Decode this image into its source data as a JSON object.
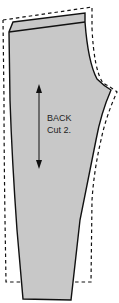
{
  "pattern_piece": {
    "name": "BACK",
    "instruction": "Cut 2.",
    "fill_color": "#c8c8c8",
    "outline_color": "#111111",
    "seam_allowance_style": "dashed",
    "grainline": "double-headed-arrow"
  }
}
